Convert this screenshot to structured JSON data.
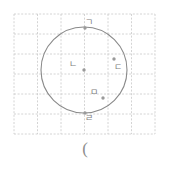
{
  "figure": {
    "kind": "geometry-diagram",
    "background_color": "#ffffff",
    "grid": {
      "line_color": "#c9c9c9",
      "style": "dashed",
      "x_start": 14,
      "y_start": 14,
      "cell_width": 23.5,
      "cell_height": 20,
      "columns": 6,
      "rows": 6
    },
    "circle": {
      "stroke_color": "#8a8a8a",
      "fill": "none",
      "center_x": 84,
      "center_y": 70,
      "radius": 43,
      "stroke_width": 1.1
    },
    "point_color": "#9a9a9a",
    "label_color": "#7d7d7d",
    "points": [
      {
        "id": "point-giyeok",
        "label": "ㄱ",
        "x": 85,
        "y": 28,
        "label_x": 89,
        "label_y": 22,
        "on_circle": true
      },
      {
        "id": "point-nieun",
        "label": "ㄴ",
        "x": 84,
        "y": 70,
        "label_x": 73,
        "label_y": 64,
        "on_circle": false
      },
      {
        "id": "point-digeut",
        "label": "ㄷ",
        "x": 114,
        "y": 59,
        "label_x": 118,
        "label_y": 67,
        "on_circle": true
      },
      {
        "id": "point-mieum",
        "label": "ㅁ",
        "x": 103,
        "y": 98,
        "label_x": 94,
        "label_y": 92,
        "on_circle": false
      },
      {
        "id": "point-rieul",
        "label": "ㄹ",
        "x": 85,
        "y": 113,
        "label_x": 89,
        "label_y": 118,
        "on_circle": true
      }
    ]
  },
  "caption": {
    "text": "("
  }
}
